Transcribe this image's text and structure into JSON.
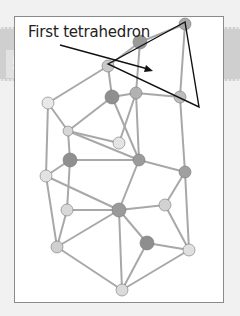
{
  "step": {
    "number": "5"
  },
  "annotation": {
    "label": "First tetrahedron"
  },
  "colors": {
    "band": "#cfcfcf",
    "frame_bg": "#ffffff",
    "annotation_line": "#111111",
    "strut": "#9a9a9a",
    "ball": "#8f8f8f"
  },
  "model": {
    "description": "Ball-and-stick geometric structure built from tetrahedra",
    "highlighted": "first tetrahedron (triangle outline with arrow)"
  }
}
